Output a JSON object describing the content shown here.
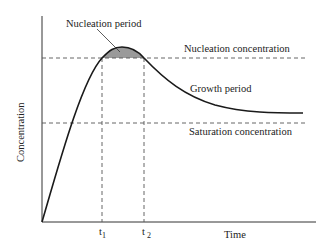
{
  "diagram": {
    "type": "concentration-vs-time (LaMer diagram)",
    "y_axis_label": "Concentration",
    "x_axis_label": "Time",
    "labels": {
      "nucleation_period": "Nucleation period",
      "nucleation_concentration": "Nucleation concentration",
      "growth_period": "Growth period",
      "saturation_concentration": "Saturation concentration"
    },
    "time_marks": {
      "t1": {
        "base": "t",
        "sub": "1"
      },
      "t2": {
        "base": "t",
        "sub": "2"
      }
    },
    "colors": {
      "line": "#1a1a1a",
      "dashed": "#555555",
      "shaded_region": "#9a9a9a"
    }
  }
}
